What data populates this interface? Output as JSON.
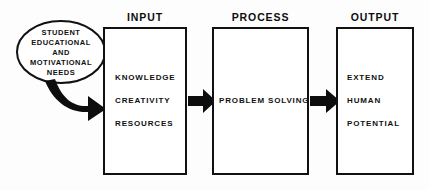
{
  "diagram": {
    "colors": {
      "stroke": "#111111",
      "fill": "#ffffff",
      "arrow": "#0d0d0d",
      "background": "#fdfdfd"
    },
    "source_node": {
      "shape": "ellipse",
      "lines": [
        "STUDENT",
        "EDUCATIONAL",
        "AND",
        "MOTIVATIONAL",
        "NEEDS"
      ]
    },
    "stages": [
      {
        "header": "INPUT",
        "lines": [
          "KNOWLEDGE",
          "CREATIVITY",
          "RESOURCES"
        ]
      },
      {
        "header": "PROCESS",
        "lines": [
          "PROBLEM SOLVING"
        ]
      },
      {
        "header": "OUTPUT",
        "lines": [
          "EXTEND",
          "HUMAN",
          "POTENTIAL"
        ]
      }
    ],
    "connectors": [
      {
        "name": "curved-arrow-needs-to-input",
        "style": "curved-block-arrow"
      },
      {
        "name": "arrow-input-to-process",
        "style": "block-arrow"
      },
      {
        "name": "arrow-process-to-output",
        "style": "block-arrow"
      }
    ]
  }
}
